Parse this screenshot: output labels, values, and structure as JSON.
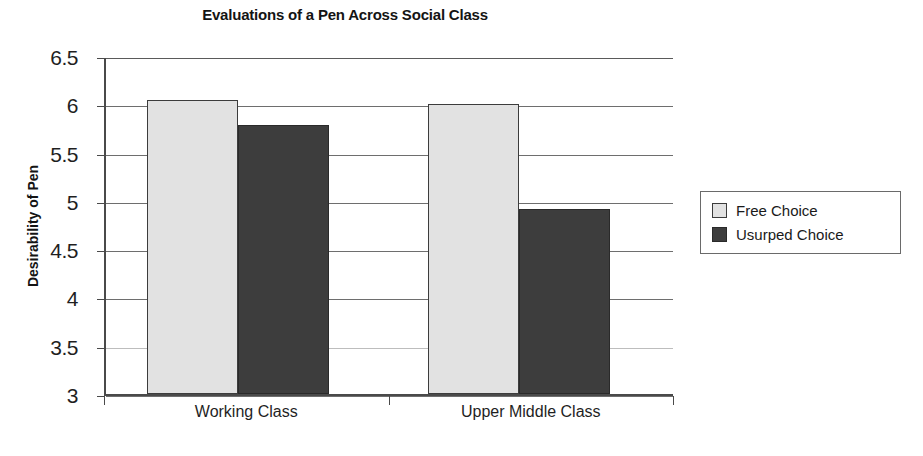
{
  "chart_data": {
    "type": "bar",
    "title": "Evaluations of a Pen Across Social Class",
    "xlabel": "",
    "ylabel": "Desirability of Pen",
    "categories": [
      "Working Class",
      "Upper Middle Class"
    ],
    "series": [
      {
        "name": "Free Choice",
        "color": "#e2e2e2",
        "values": [
          6.04,
          6.0
        ]
      },
      {
        "name": "Usurped Choice",
        "color": "#3d3d3d",
        "values": [
          5.79,
          4.92
        ]
      }
    ],
    "ylim": [
      3,
      6.5
    ],
    "ytick_labels": [
      "6.5",
      "6",
      "5.5",
      "5",
      "4.5",
      "4",
      "3.5",
      "3"
    ],
    "ytick_values": [
      6.5,
      6,
      5.5,
      5,
      4.5,
      4,
      3.5,
      3
    ],
    "grid": true,
    "grid_axis": "y",
    "legend_position": "right"
  }
}
